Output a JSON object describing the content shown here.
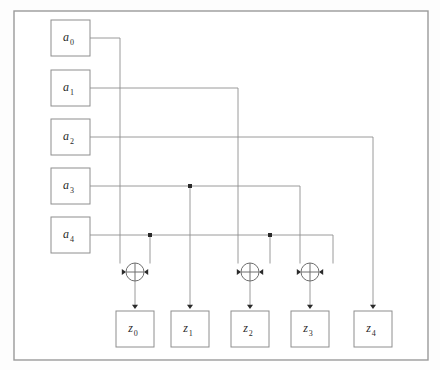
{
  "diagram": {
    "frame": {
      "x": 14,
      "y": 11,
      "width": 414,
      "height": 349
    },
    "colors": {
      "background": "#ffffff",
      "frame_stroke": "#9a9a9a",
      "box_stroke": "#8e8e8e",
      "wire_stroke": "#8e8e8e",
      "gate_stroke": "#6e6e6e",
      "dot_fill": "#2b2b2b",
      "label_fill": "#2a2a2a"
    },
    "inputs": [
      {
        "id": "a0",
        "base": "a",
        "sub": "0",
        "x": 51,
        "y": 20,
        "w": 39,
        "h": 36,
        "cx": 70.5,
        "cy": 38
      },
      {
        "id": "a1",
        "base": "a",
        "sub": "1",
        "x": 51,
        "y": 70,
        "w": 39,
        "h": 36,
        "cx": 70.5,
        "cy": 88
      },
      {
        "id": "a2",
        "base": "a",
        "sub": "2",
        "x": 51,
        "y": 119,
        "w": 39,
        "h": 36,
        "cx": 70.5,
        "cy": 137
      },
      {
        "id": "a3",
        "base": "a",
        "sub": "3",
        "x": 51,
        "y": 168,
        "w": 39,
        "h": 36,
        "cx": 70.5,
        "cy": 186
      },
      {
        "id": "a4",
        "base": "a",
        "sub": "4",
        "x": 51,
        "y": 217,
        "w": 39,
        "h": 36,
        "cx": 70.5,
        "cy": 235
      }
    ],
    "outputs": [
      {
        "id": "z0",
        "base": "z",
        "sub": "0",
        "x": 116,
        "y": 311,
        "w": 38,
        "h": 36,
        "cx": 135,
        "cy": 329
      },
      {
        "id": "z1",
        "base": "z",
        "sub": "1",
        "x": 171,
        "y": 311,
        "w": 38,
        "h": 36,
        "cx": 190,
        "cy": 329
      },
      {
        "id": "z2",
        "base": "z",
        "sub": "2",
        "x": 231,
        "y": 311,
        "w": 38,
        "h": 36,
        "cx": 250,
        "cy": 329
      },
      {
        "id": "z3",
        "base": "z",
        "sub": "3",
        "x": 291,
        "y": 311,
        "w": 38,
        "h": 36,
        "cx": 310,
        "cy": 329
      },
      {
        "id": "z4",
        "base": "z",
        "sub": "4",
        "x": 354,
        "y": 311,
        "w": 38,
        "h": 36,
        "cx": 373,
        "cy": 329
      }
    ],
    "gates": [
      {
        "id": "xor0",
        "type": "xor",
        "cx": 135,
        "cy": 272,
        "r": 9,
        "output": "z0",
        "inputs": [
          "a0",
          "a4"
        ]
      },
      {
        "id": "xor2",
        "type": "xor",
        "cx": 250,
        "cy": 272,
        "r": 9,
        "output": "z2",
        "inputs": [
          "a1",
          "a4"
        ]
      },
      {
        "id": "xor3",
        "type": "xor",
        "cx": 310,
        "cy": 272,
        "r": 9,
        "output": "z3",
        "inputs": [
          "a3",
          "a4"
        ]
      }
    ],
    "wires": [
      {
        "id": "w-a0",
        "from": "a0",
        "to": "xor0-left",
        "path": "M90,38 H120 V263"
      },
      {
        "id": "w-a1",
        "from": "a1",
        "to": "xor2-left",
        "path": "M90,88 H238 V263"
      },
      {
        "id": "w-a2",
        "from": "a2",
        "to": "z4",
        "path": "M90,137 H373 V305"
      },
      {
        "id": "w-a3-main",
        "from": "a3",
        "to": "xor3-left",
        "path": "M90,186 H300 V263"
      },
      {
        "id": "w-a3-tap-z1",
        "from": "a3",
        "to": "z1",
        "path": "M190,186 V305"
      },
      {
        "id": "w-a4-main",
        "from": "a4",
        "to": "xor3-right",
        "path": "M90,235 H333 V263"
      },
      {
        "id": "w-a4-tap-xor0",
        "from": "a4",
        "to": "xor0-right",
        "path": "M150,235 V263"
      },
      {
        "id": "w-a4-tap-xor2",
        "from": "a4",
        "to": "xor2-right",
        "path": "M270,235 V263"
      },
      {
        "id": "w-xor0-out",
        "from": "xor0",
        "to": "z0",
        "path": "M135,281 V305"
      },
      {
        "id": "w-xor2-out",
        "from": "xor2",
        "to": "z2",
        "path": "M250,281 V305"
      },
      {
        "id": "w-xor3-out",
        "from": "xor3",
        "to": "z3",
        "path": "M310,281 V305"
      }
    ],
    "junctions": [
      {
        "id": "j-a3-z1",
        "x": 190,
        "y": 186,
        "on_wire": "a3"
      },
      {
        "id": "j-a4-xor0",
        "x": 150,
        "y": 235,
        "on_wire": "a4"
      },
      {
        "id": "j-a4-xor2",
        "x": 270,
        "y": 235,
        "on_wire": "a4"
      }
    ],
    "arrows": [
      {
        "id": "arr-xor0-left",
        "x": 126,
        "y": 272,
        "dir": "right"
      },
      {
        "id": "arr-xor0-right",
        "x": 144,
        "y": 272,
        "dir": "left"
      },
      {
        "id": "arr-xor2-left",
        "x": 241,
        "y": 272,
        "dir": "right"
      },
      {
        "id": "arr-xor2-right",
        "x": 259,
        "y": 272,
        "dir": "left"
      },
      {
        "id": "arr-xor3-left",
        "x": 301,
        "y": 272,
        "dir": "right"
      },
      {
        "id": "arr-xor3-right",
        "x": 319,
        "y": 272,
        "dir": "left"
      },
      {
        "id": "arr-z0",
        "x": 135,
        "y": 309,
        "dir": "down"
      },
      {
        "id": "arr-z1",
        "x": 190,
        "y": 309,
        "dir": "down"
      },
      {
        "id": "arr-z2",
        "x": 250,
        "y": 309,
        "dir": "down"
      },
      {
        "id": "arr-z3",
        "x": 310,
        "y": 309,
        "dir": "down"
      },
      {
        "id": "arr-z4",
        "x": 373,
        "y": 309,
        "dir": "down"
      }
    ]
  }
}
